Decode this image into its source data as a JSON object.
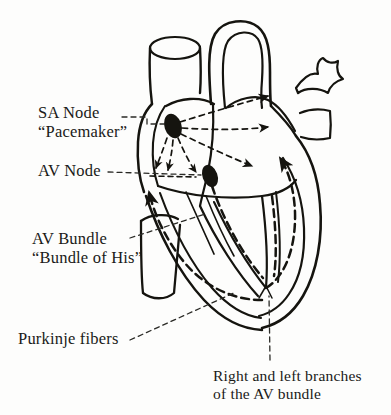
{
  "figure": {
    "background_color": "#fdfdfc",
    "ink_color": "#1a1a18"
  },
  "labels": {
    "sa_node": {
      "line1": "SA Node",
      "line2": "“Pacemaker”"
    },
    "av_node": {
      "line1": "AV Node"
    },
    "av_bundle": {
      "line1": "AV Bundle",
      "line2": "“Bundle of His”"
    },
    "purkinje": {
      "line1": "Purkinje fibers"
    },
    "branches_caption": {
      "line1": "Right and left branches",
      "line2": "of the AV bundle"
    }
  },
  "structures": [
    {
      "name": "superior-vena-cava",
      "kind": "vessel"
    },
    {
      "name": "aorta",
      "kind": "vessel"
    },
    {
      "name": "pulmonary-veins",
      "kind": "vessel"
    },
    {
      "name": "inferior-vena-cava",
      "kind": "vessel"
    },
    {
      "name": "right-atrium",
      "kind": "chamber"
    },
    {
      "name": "left-atrium",
      "kind": "chamber"
    },
    {
      "name": "right-ventricle",
      "kind": "chamber"
    },
    {
      "name": "left-ventricle",
      "kind": "chamber"
    },
    {
      "name": "interventricular-septum",
      "kind": "wall"
    },
    {
      "name": "sa-node-marker",
      "kind": "node"
    },
    {
      "name": "av-node-marker",
      "kind": "node"
    },
    {
      "name": "conduction-arrows",
      "kind": "pathway"
    },
    {
      "name": "purkinje-fiber-paths",
      "kind": "pathway"
    },
    {
      "name": "bundle-branch-fork",
      "kind": "pathway"
    }
  ]
}
